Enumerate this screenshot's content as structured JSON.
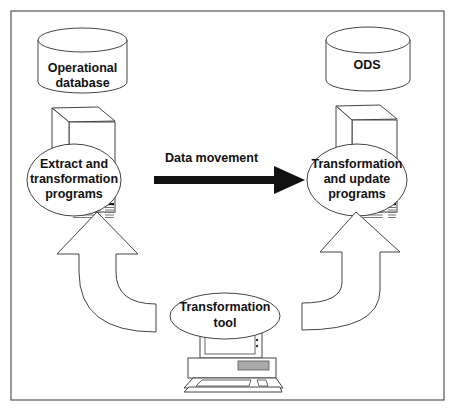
{
  "diagram": {
    "title": "",
    "nodes": {
      "operational_db": {
        "line1": "Operational",
        "line2": "database",
        "shape": "cylinder"
      },
      "ods": {
        "line1": "ODS",
        "shape": "cylinder"
      },
      "extract_programs": {
        "line1": "Extract and",
        "line2": "transformation",
        "line3": "programs",
        "shape": "ellipse-on-server"
      },
      "update_programs": {
        "line1": "Transformation",
        "line2": "and update",
        "line3": "programs",
        "shape": "ellipse-on-server"
      },
      "transformation_tool": {
        "line1": "Transformation",
        "line2": "tool",
        "shape": "ellipse-on-workstation"
      }
    },
    "edges": [
      {
        "from": "extract_programs",
        "to": "update_programs",
        "label": "Data movement",
        "style": "thick-black-arrow"
      },
      {
        "from": "transformation_tool",
        "to": "extract_programs",
        "label": "",
        "style": "curved-hollow-arrow"
      },
      {
        "from": "transformation_tool",
        "to": "update_programs",
        "label": "",
        "style": "curved-hollow-arrow"
      }
    ],
    "colors": {
      "stroke": "#444444",
      "arrow_fill": "#111111",
      "disk_slot": "#999999"
    }
  }
}
